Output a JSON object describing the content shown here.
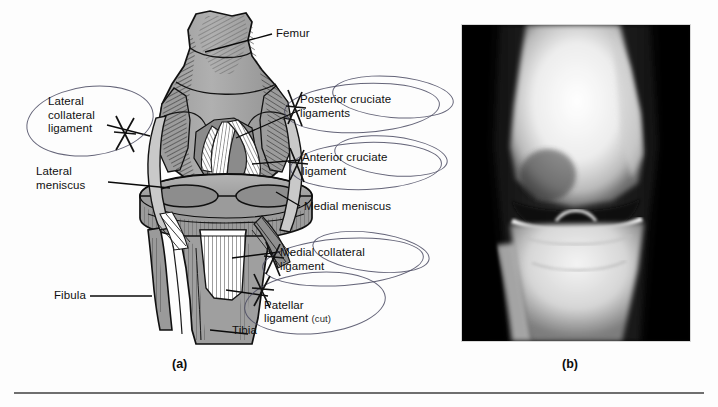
{
  "figure": {
    "panels": [
      {
        "letter": "(a)",
        "kind": "anatomical-illustration"
      },
      {
        "letter": "(b)",
        "kind": "radiograph"
      }
    ]
  },
  "labels": {
    "femur": "Femur",
    "lateral_collateral_ligament": "Lateral\ncollateral\nligament",
    "lateral_meniscus": "Lateral\nmeniscus",
    "posterior_cruciate_ligaments": "Posterior cruciate\nligaments",
    "anterior_cruciate_ligament": "Anterior cruciate\nligament",
    "medial_meniscus": "Medial meniscus",
    "medial_collateral_ligament": "Medial collateral\nligament",
    "patellar_ligament": "Patellar\nligament ",
    "patellar_ligament_note": "(cut)",
    "fibula": "Fibula",
    "tibia": "Tibia"
  },
  "colors": {
    "page_background": "#fdfdfd",
    "bone_gray": "#a8a8a8",
    "bone_gray_dark": "#8d8d8d",
    "ink_black": "#0a0a0a",
    "annotation_ink": "#4a4a62",
    "xray_background": "#050505",
    "xray_bone_bright": "#fbfbfb",
    "rule_gray": "#6f6f6f"
  }
}
